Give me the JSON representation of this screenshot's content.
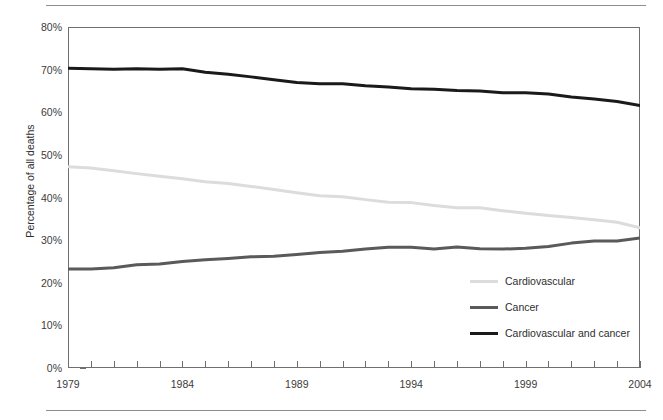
{
  "chart_data": {
    "type": "line",
    "title": "",
    "xlabel": "",
    "ylabel": "Percentage of all deaths",
    "xlim": [
      1979,
      2004
    ],
    "ylim": [
      0,
      80
    ],
    "grid": false,
    "legend_position": "inside-lower-right",
    "y_tick_labels": [
      "0%",
      "10%",
      "20%",
      "30%",
      "40%",
      "50%",
      "60%",
      "70%",
      "80%"
    ],
    "y_tick_values": [
      0,
      10,
      20,
      30,
      40,
      50,
      60,
      70,
      80
    ],
    "x_tick_labels": [
      "1979",
      "1984",
      "1989",
      "1994",
      "1999",
      "2004"
    ],
    "x_tick_values": [
      1979,
      1984,
      1989,
      1994,
      1999,
      2004
    ],
    "x_minor_ticks": [
      1979,
      1980,
      1981,
      1982,
      1983,
      1984,
      1985,
      1986,
      1987,
      1988,
      1989,
      1990,
      1991,
      1992,
      1993,
      1994,
      1995,
      1996,
      1997,
      1998,
      1999,
      2000,
      2001,
      2002,
      2003,
      2004
    ],
    "x": [
      1979,
      1980,
      1981,
      1982,
      1983,
      1984,
      1985,
      1986,
      1987,
      1988,
      1989,
      1990,
      1991,
      1992,
      1993,
      1994,
      1995,
      1996,
      1997,
      1998,
      1999,
      2000,
      2001,
      2002,
      2003,
      2004
    ],
    "series": [
      {
        "name": "Cardiovascular",
        "color": "#dcdcdc",
        "values": [
          47.2,
          46.9,
          46.3,
          45.6,
          45.0,
          44.4,
          43.7,
          43.3,
          42.6,
          41.9,
          41.1,
          40.4,
          40.2,
          39.5,
          38.9,
          38.8,
          38.1,
          37.6,
          37.6,
          36.9,
          36.3,
          35.8,
          35.3,
          34.8,
          34.2,
          32.9
        ]
      },
      {
        "name": "Cancer",
        "color": "#5a5a5a",
        "values": [
          23.2,
          23.2,
          23.5,
          24.2,
          24.4,
          25.0,
          25.4,
          25.7,
          26.1,
          26.2,
          26.6,
          27.1,
          27.4,
          27.9,
          28.3,
          28.3,
          27.9,
          28.4,
          28.0,
          27.9,
          28.1,
          28.5,
          29.3,
          29.8,
          29.8,
          30.5
        ]
      },
      {
        "name": "Cardiovascular and cancer",
        "color": "#1a1a1a",
        "values": [
          70.3,
          70.2,
          70.1,
          70.2,
          70.1,
          70.2,
          69.4,
          68.9,
          68.3,
          67.6,
          67.0,
          66.7,
          66.7,
          66.2,
          65.9,
          65.5,
          65.4,
          65.1,
          65.0,
          64.6,
          64.6,
          64.3,
          63.6,
          63.1,
          62.5,
          61.6
        ]
      }
    ]
  },
  "axis": {
    "y_title": "Percentage of all deaths"
  }
}
